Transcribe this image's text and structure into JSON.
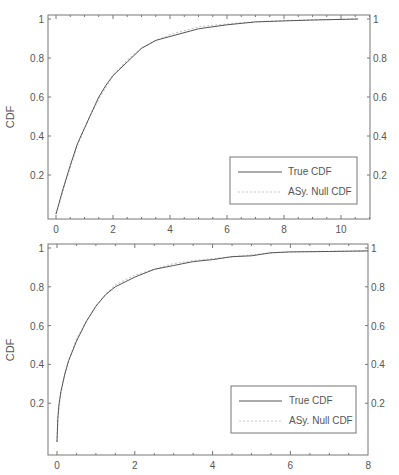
{
  "chart_data": [
    {
      "type": "line",
      "title": "",
      "xlabel": "",
      "ylabel": "CDF",
      "xlim": [
        -0.3,
        11
      ],
      "ylim": [
        0,
        1.01
      ],
      "x_ticks": [
        "0",
        "2",
        "4",
        "6",
        "8",
        "10"
      ],
      "x_tick_values": [
        0,
        2,
        4,
        6,
        8,
        10
      ],
      "y_ticks_left": [
        "0.2",
        "0.4",
        "0.6",
        "0.8",
        "1"
      ],
      "y_ticks_right": [
        "0.2",
        "0.4",
        "0.6",
        "0.8",
        "1"
      ],
      "y_tick_values": [
        0.2,
        0.4,
        0.6,
        0.8,
        1
      ],
      "grid": false,
      "legend_position": "lower right",
      "series": [
        {
          "name": "True CDF",
          "style": "solid",
          "color": "#555555",
          "x": [
            0,
            0.25,
            0.5,
            0.75,
            1.0,
            1.25,
            1.5,
            1.75,
            2.0,
            2.5,
            3.0,
            3.5,
            4.0,
            5.0,
            6.0,
            7.0,
            8.0,
            9.0,
            10.0,
            10.6
          ],
          "y": [
            0.0,
            0.13,
            0.25,
            0.36,
            0.44,
            0.52,
            0.6,
            0.66,
            0.71,
            0.78,
            0.85,
            0.89,
            0.91,
            0.95,
            0.97,
            0.985,
            0.99,
            0.995,
            0.998,
            1.0
          ]
        },
        {
          "name": "ASy. Null CDF",
          "style": "dotted",
          "color": "#c8c8c8",
          "x": [
            0,
            0.25,
            0.5,
            0.75,
            1.0,
            1.25,
            1.5,
            1.75,
            2.0,
            2.5,
            3.0,
            3.5,
            4.0,
            5.0,
            6.0,
            7.0,
            8.0,
            9.0,
            10.0,
            10.6
          ],
          "y": [
            0.0,
            0.12,
            0.24,
            0.35,
            0.44,
            0.52,
            0.59,
            0.65,
            0.71,
            0.79,
            0.85,
            0.89,
            0.92,
            0.96,
            0.975,
            0.985,
            0.992,
            0.996,
            0.998,
            1.0
          ]
        }
      ]
    },
    {
      "type": "line",
      "title": "",
      "xlabel": "",
      "ylabel": "CDF",
      "xlim": [
        -0.3,
        8
      ],
      "ylim": [
        0,
        1.01
      ],
      "x_ticks": [
        "0",
        "2",
        "4",
        "6",
        "8"
      ],
      "x_tick_values": [
        0,
        2,
        4,
        6,
        8
      ],
      "y_ticks_left": [
        "0.2",
        "0.4",
        "0.6",
        "0.8",
        "1"
      ],
      "y_ticks_right": [
        "0.2",
        "0.4",
        "0.6",
        "0.8",
        "1"
      ],
      "y_tick_values": [
        0.2,
        0.4,
        0.6,
        0.8,
        1
      ],
      "grid": false,
      "legend_position": "lower right",
      "series": [
        {
          "name": "True CDF",
          "style": "solid",
          "color": "#555555",
          "x": [
            0,
            0.02,
            0.05,
            0.1,
            0.2,
            0.3,
            0.5,
            0.75,
            1.0,
            1.25,
            1.5,
            2.0,
            2.5,
            3.0,
            3.5,
            4.0,
            4.5,
            5.0,
            5.5,
            6.0,
            7.0,
            8.0
          ],
          "y": [
            0.0,
            0.12,
            0.19,
            0.26,
            0.35,
            0.42,
            0.52,
            0.62,
            0.7,
            0.76,
            0.8,
            0.85,
            0.89,
            0.91,
            0.93,
            0.94,
            0.955,
            0.96,
            0.975,
            0.98,
            0.982,
            0.985
          ]
        },
        {
          "name": "ASy. Null CDF",
          "style": "dotted",
          "color": "#c8c8c8",
          "x": [
            0,
            0.02,
            0.05,
            0.1,
            0.2,
            0.3,
            0.5,
            0.75,
            1.0,
            1.25,
            1.5,
            2.0,
            2.5,
            3.0,
            3.5,
            4.0,
            4.5,
            5.0,
            5.5,
            6.0,
            7.0,
            8.0
          ],
          "y": [
            0.0,
            0.11,
            0.18,
            0.25,
            0.35,
            0.42,
            0.53,
            0.62,
            0.7,
            0.76,
            0.81,
            0.86,
            0.89,
            0.92,
            0.935,
            0.945,
            0.955,
            0.965,
            0.975,
            0.98,
            0.983,
            0.986
          ]
        }
      ]
    }
  ],
  "panels": [
    {
      "ylabel": "CDF",
      "x_ticks": [
        "0",
        "2",
        "4",
        "6",
        "8",
        "10"
      ],
      "y_ticks": [
        "0.2",
        "0.4",
        "0.6",
        "0.8",
        "1"
      ],
      "legend": {
        "true_label": "True CDF",
        "null_label": "ASy. Null CDF"
      }
    },
    {
      "ylabel": "CDF",
      "x_ticks": [
        "0",
        "2",
        "4",
        "6",
        "8"
      ],
      "y_ticks": [
        "0.2",
        "0.4",
        "0.6",
        "0.8",
        "1"
      ],
      "legend": {
        "true_label": "True CDF",
        "null_label": "ASy. Null CDF"
      }
    }
  ],
  "colors": {
    "axis": "#777777",
    "true_line": "#555555",
    "null_line": "#c8c8c8",
    "text": "#555555"
  }
}
